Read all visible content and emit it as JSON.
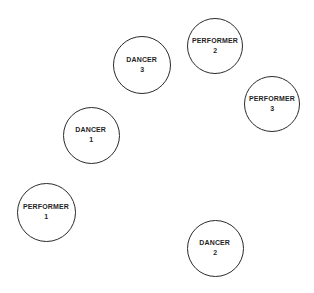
{
  "canvas": {
    "width": 314,
    "height": 293,
    "background_color": "#ffffff",
    "stroke_color": "#2b2b2b",
    "text_color": "#1f1f1f"
  },
  "diagram": {
    "type": "node-scatter",
    "node_count": 6,
    "nodes": [
      {
        "id": "dancer-3",
        "role": "DANCER",
        "index": "3",
        "cx": 142,
        "cy": 65,
        "diameter": 58
      },
      {
        "id": "performer-2",
        "role": "PERFORMER",
        "index": "2",
        "cx": 215,
        "cy": 46,
        "diameter": 56
      },
      {
        "id": "performer-3",
        "role": "PERFORMER",
        "index": "3",
        "cx": 272,
        "cy": 104,
        "diameter": 56
      },
      {
        "id": "dancer-1",
        "role": "DANCER",
        "index": "1",
        "cx": 91,
        "cy": 135,
        "diameter": 57
      },
      {
        "id": "performer-1",
        "role": "PERFORMER",
        "index": "1",
        "cx": 46,
        "cy": 212,
        "diameter": 59
      },
      {
        "id": "dancer-2",
        "role": "DANCER",
        "index": "2",
        "cx": 215,
        "cy": 248,
        "diameter": 57
      }
    ]
  }
}
